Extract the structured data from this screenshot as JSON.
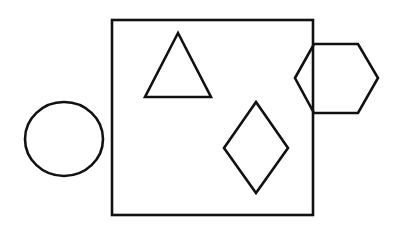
{
  "canvas": {
    "width": 404,
    "height": 229,
    "background": "#ffffff"
  },
  "stroke": {
    "color": "#111111",
    "width": 2.6
  },
  "shapes": {
    "square": {
      "x": 112,
      "y": 20,
      "width": 201,
      "height": 195
    },
    "triangle": {
      "points": "178,33 145,97 211,97"
    },
    "hexagon": {
      "points": "295,78 314,44 358,44 378,78 358,113 314,113"
    },
    "circle": {
      "cx": 64,
      "cy": 139,
      "rx": 39,
      "ry": 37
    },
    "diamond": {
      "points": "256,102 288,148 256,193 224,148"
    }
  }
}
